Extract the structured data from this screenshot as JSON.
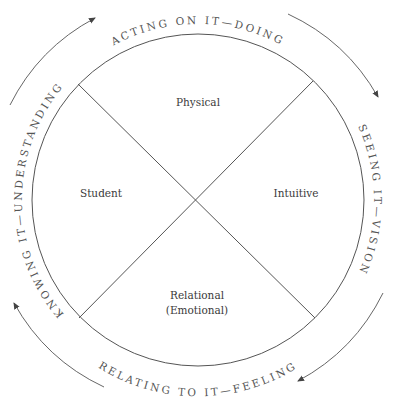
{
  "diagram": {
    "quadrants": {
      "top": "Physical",
      "left": "Student",
      "right": "Intuitive",
      "bottom_line1": "Relational",
      "bottom_line2": "(Emotional)"
    },
    "arc_labels": {
      "top": "ACTING ON IT—DOING",
      "right": "SEEING IT—VISION",
      "bottom": "RELATING TO IT—FEELING",
      "left": "KNOWING IT—UNDERSTANDING"
    },
    "colors": {
      "line": "#555555",
      "text": "#3a3a3a",
      "background": "#ffffff"
    }
  }
}
